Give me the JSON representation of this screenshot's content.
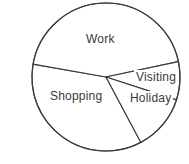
{
  "chart_data": {
    "type": "pie",
    "title": "",
    "categories": [
      "Work",
      "Visiting",
      "Holiday",
      "Shopping"
    ],
    "values": [
      38,
      8,
      12,
      42
    ],
    "unit": "percent",
    "labels_inside": true,
    "legend": "none",
    "slices": [
      {
        "name": "Work",
        "value": 38,
        "start_angle_deg": 190,
        "end_angle_deg": 348,
        "fill": "#ffffff",
        "stroke": "#3a3a3a"
      },
      {
        "name": "Visiting",
        "value": 8,
        "start_angle_deg": 348,
        "end_angle_deg": 18,
        "fill": "#ffffff",
        "stroke": "#3a3a3a"
      },
      {
        "name": "Holiday",
        "value": 12,
        "start_angle_deg": 18,
        "end_angle_deg": 62,
        "fill": "#ffffff",
        "stroke": "#3a3a3a"
      },
      {
        "name": "Shopping",
        "value": 42,
        "start_angle_deg": 62,
        "end_angle_deg": 190,
        "fill": "#ffffff",
        "stroke": "#3a3a3a"
      }
    ],
    "geometry": {
      "center_x": 106,
      "center_y": 77,
      "radius": 74
    },
    "style": {
      "outline_color": "#3a3a3a",
      "slice_fill": "#ffffff",
      "label_color": "#3a3a3a",
      "background": "#ffffff"
    }
  },
  "labels": {
    "work": "Work",
    "visiting": "Visiting",
    "holiday": "Holiday",
    "shopping": "Shopping"
  }
}
